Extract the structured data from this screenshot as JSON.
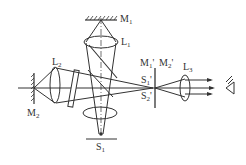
{
  "diagram": {
    "labels": {
      "M1": {
        "main": "M",
        "sub": "1"
      },
      "L1": {
        "main": "L",
        "sub": "1"
      },
      "L2": {
        "main": "L",
        "sub": "2"
      },
      "M2": {
        "main": "M",
        "sub": "2"
      },
      "M1p": {
        "main": "M",
        "sub": "1",
        "prime": "'"
      },
      "M2p": {
        "main": "M",
        "sub": "2",
        "prime": "'"
      },
      "S1p": {
        "main": "S",
        "sub": "1",
        "prime": "'"
      },
      "S2p": {
        "main": "S",
        "sub": "2",
        "prime": "'"
      },
      "L3": {
        "main": "L",
        "sub": "3"
      },
      "S": {
        "main": "S",
        "sub": "1"
      }
    },
    "colors": {
      "line": "#333333",
      "background": "#ffffff"
    }
  }
}
